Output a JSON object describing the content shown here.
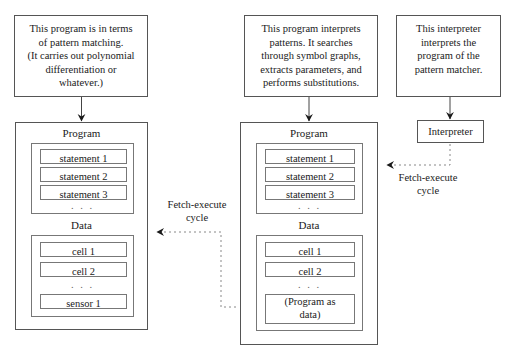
{
  "notes": {
    "left": {
      "lines": [
        "This program is in terms",
        "of pattern matching.",
        "(It carries out polynomial",
        "differentiation or",
        "whatever.)"
      ]
    },
    "middle": {
      "lines": [
        "This program interprets",
        "patterns.  It searches",
        "through symbol graphs,",
        "extracts parameters, and",
        "performs substitutions."
      ]
    },
    "right": {
      "lines": [
        "This interpreter",
        "interprets the",
        "program of the",
        "pattern matcher."
      ]
    }
  },
  "left_machine": {
    "program": {
      "label": "Program",
      "items": [
        "statement 1",
        "statement 2",
        "statement 3"
      ],
      "ellipsis": ". . ."
    },
    "data": {
      "label": "Data",
      "items": [
        "cell 1",
        "cell 2"
      ],
      "ellipsis": ". . .",
      "trailing_item": "sensor 1"
    }
  },
  "middle_machine": {
    "program": {
      "label": "Program",
      "items": [
        "statement 1",
        "statement 2",
        "statement 3"
      ],
      "ellipsis": ". . ."
    },
    "data": {
      "label": "Data",
      "items": [
        "cell 1",
        "cell 2"
      ],
      "ellipsis": ". . .",
      "trailing_item_lines": [
        "(Program as",
        "data)"
      ]
    }
  },
  "interpreter": {
    "label": "Interpreter"
  },
  "cycles": {
    "left": {
      "line1": "Fetch-execute",
      "line2": "cycle"
    },
    "right": {
      "line1": "Fetch-execute",
      "line2": "cycle"
    }
  },
  "colors": {
    "stroke": "#555555",
    "inner_stroke": "#777777",
    "dotted": "#888888",
    "text": "#1a1a1a",
    "background": "#ffffff"
  }
}
